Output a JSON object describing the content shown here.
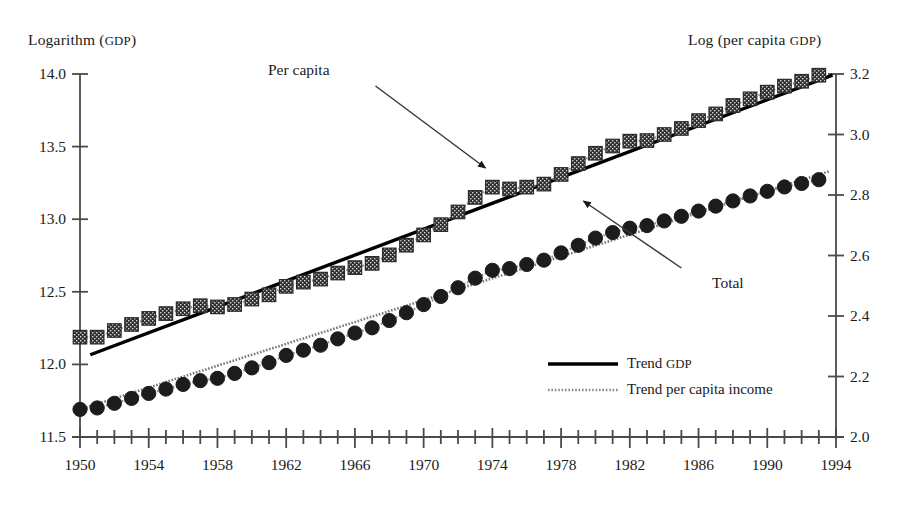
{
  "chart_data": {
    "type": "scatter",
    "title": "",
    "xlabel": "",
    "ylabel_left": "Logarithm (GDP)",
    "ylabel_right": "Log (per capita GDP)",
    "grid": false,
    "legend_position": "inside-lower-right",
    "xlim": [
      1950,
      1994
    ],
    "ylim_left": [
      11.5,
      14.0
    ],
    "ylim_right": [
      2.0,
      3.2
    ],
    "xticks_major": [
      1950,
      1954,
      1958,
      1962,
      1966,
      1970,
      1974,
      1978,
      1982,
      1986,
      1990,
      1994
    ],
    "xticks_minor_every": 1,
    "yticks_left": [
      "11.5",
      "12.0",
      "12.5",
      "13.0",
      "13.5",
      "14.0"
    ],
    "yticks_right": [
      "2.0",
      "2.2",
      "2.4",
      "2.6",
      "2.8",
      "3.0",
      "3.2"
    ],
    "x": [
      1950,
      1951,
      1952,
      1953,
      1954,
      1955,
      1956,
      1957,
      1958,
      1959,
      1960,
      1961,
      1962,
      1963,
      1964,
      1965,
      1966,
      1967,
      1968,
      1969,
      1970,
      1971,
      1972,
      1973,
      1974,
      1975,
      1976,
      1977,
      1978,
      1979,
      1980,
      1981,
      1982,
      1983,
      1984,
      1985,
      1986,
      1987,
      1988,
      1989,
      1990,
      1991,
      1992,
      1993
    ],
    "series": [
      {
        "name": "Per capita",
        "axis": "right",
        "marker": "square",
        "marker_color": "#2b2b2b",
        "connector": "dotted",
        "values": [
          2.33,
          2.33,
          2.352,
          2.372,
          2.392,
          2.408,
          2.424,
          2.434,
          2.43,
          2.438,
          2.456,
          2.47,
          2.498,
          2.512,
          2.522,
          2.542,
          2.56,
          2.574,
          2.602,
          2.634,
          2.668,
          2.702,
          2.744,
          2.792,
          2.826,
          2.82,
          2.826,
          2.836,
          2.868,
          2.904,
          2.938,
          2.962,
          2.978,
          2.98,
          3.0,
          3.02,
          3.046,
          3.068,
          3.096,
          3.118,
          3.14,
          3.16,
          3.176,
          3.196
        ]
      },
      {
        "name": "Total",
        "axis": "left",
        "marker": "circle",
        "marker_color": "#1c1c1c",
        "connector": "dotted",
        "values": [
          11.69,
          11.7,
          11.732,
          11.766,
          11.8,
          11.83,
          11.862,
          11.888,
          11.904,
          11.938,
          11.976,
          12.012,
          12.062,
          12.098,
          12.132,
          12.176,
          12.216,
          12.252,
          12.302,
          12.356,
          12.412,
          12.468,
          12.528,
          12.594,
          12.648,
          12.66,
          12.688,
          12.718,
          12.768,
          12.82,
          12.87,
          12.908,
          12.938,
          12.956,
          12.988,
          13.02,
          13.056,
          13.09,
          13.126,
          13.16,
          13.192,
          13.222,
          13.246,
          13.272
        ]
      }
    ],
    "trends": [
      {
        "name": "Trend GDP",
        "axis": "right",
        "style": "solid",
        "color": "#000000",
        "x0": 1950.6,
        "y0": 2.272,
        "x1": 1993.8,
        "y1": 3.196
      },
      {
        "name": "Trend per capita income",
        "axis": "left",
        "style": "dotted",
        "color": "#7a7a7a",
        "x0": 1950.0,
        "y0": 11.69,
        "x1": 1993.6,
        "y1": 13.33
      }
    ],
    "annotations": [
      {
        "label": "Per capita",
        "text_x": 1963.2,
        "text_y_px": 61,
        "arrow_from_x": 1967.2,
        "arrow_from_y_px": 86,
        "arrow_to_x": 1973.6,
        "arrow_to_y_px": 168
      },
      {
        "label": "Total",
        "text_x": 1985.6,
        "text_y_px": 274,
        "arrow_from_x": 1985.0,
        "arrow_from_y_px": 268,
        "arrow_to_x": 1979.3,
        "arrow_to_y_px": 201
      }
    ],
    "legend_entries": [
      {
        "label": "Trend GDP",
        "style": "solid",
        "color": "#000000"
      },
      {
        "label": "Trend per capita income",
        "style": "dotted",
        "color": "#8a8a8a"
      }
    ]
  },
  "axes": {
    "left_title_main": "Logarithm (",
    "left_title_sc": "GDP",
    "left_title_tail": ")",
    "right_title_main": "Log (per capita ",
    "right_title_sc": "GDP",
    "right_title_tail": ")"
  },
  "legend": {
    "entry_0_main": "Trend ",
    "entry_0_sc": "GDP",
    "entry_1_label": "Trend per capita income"
  },
  "annotations": {
    "per_capita": "Per capita",
    "total": "Total"
  }
}
